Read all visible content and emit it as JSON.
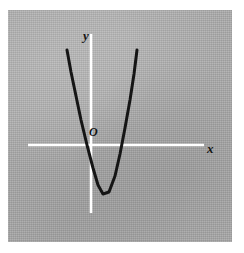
{
  "figure": {
    "background_color": "#a9a9a9",
    "page_color": "#ffffff",
    "axis_color": "#ffffff",
    "curve_color": "#151515",
    "label_color": "#151515"
  },
  "labels": {
    "y_axis": "y",
    "x_axis": "x",
    "origin": "O"
  },
  "chart_data": {
    "type": "line",
    "title": "",
    "xlabel": "x",
    "ylabel": "y",
    "origin_label": "O",
    "grid": false,
    "legend": null,
    "axes": {
      "x_axis": {
        "label": "x",
        "y_pixel": 135,
        "x_start_pixel": 20,
        "x_end_pixel": 196,
        "color": "#ffffff"
      },
      "y_axis": {
        "label": "y",
        "x_pixel": 83,
        "y_start_pixel": 24,
        "y_end_pixel": 203,
        "color": "#ffffff"
      }
    },
    "series": [
      {
        "name": "parabola",
        "shape": "upward-opening parabola",
        "vertex": {
          "x": 95,
          "y": 184
        },
        "x_intercepts": [
          79,
          114
        ],
        "y_intercept_below_origin": true,
        "color": "#151515",
        "line_width": 3,
        "points": [
          {
            "x": 59,
            "y": 40
          },
          {
            "x": 63,
            "y": 62
          },
          {
            "x": 68,
            "y": 86
          },
          {
            "x": 73,
            "y": 110
          },
          {
            "x": 79,
            "y": 135
          },
          {
            "x": 85,
            "y": 158
          },
          {
            "x": 90,
            "y": 175
          },
          {
            "x": 95,
            "y": 184
          },
          {
            "x": 101,
            "y": 182
          },
          {
            "x": 107,
            "y": 166
          },
          {
            "x": 112,
            "y": 144
          },
          {
            "x": 117,
            "y": 118
          },
          {
            "x": 122,
            "y": 90
          },
          {
            "x": 126,
            "y": 64
          },
          {
            "x": 129,
            "y": 40
          }
        ]
      }
    ]
  }
}
